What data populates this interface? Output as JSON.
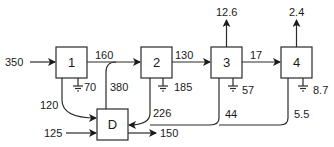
{
  "diagram": {
    "type": "flow-network",
    "nodes": [
      {
        "id": "1",
        "label": "1"
      },
      {
        "id": "2",
        "label": "2"
      },
      {
        "id": "3",
        "label": "3"
      },
      {
        "id": "4",
        "label": "4"
      },
      {
        "id": "D",
        "label": "D"
      }
    ],
    "flows": {
      "in_1": "350",
      "n1_to_n2": "160",
      "n1_ground": "70",
      "n1_to_D": "120",
      "D_to_n2": "380",
      "in_D": "125",
      "D_out": "150",
      "n2_to_n3": "130",
      "n2_ground": "185",
      "n2_to_D": "226",
      "n3_up": "12.6",
      "n3_to_n4": "17",
      "n3_ground": "57",
      "n3_to_D": "44",
      "n4_up": "2.4",
      "n4_ground": "8.7",
      "n4_to_D": "5.5"
    }
  }
}
